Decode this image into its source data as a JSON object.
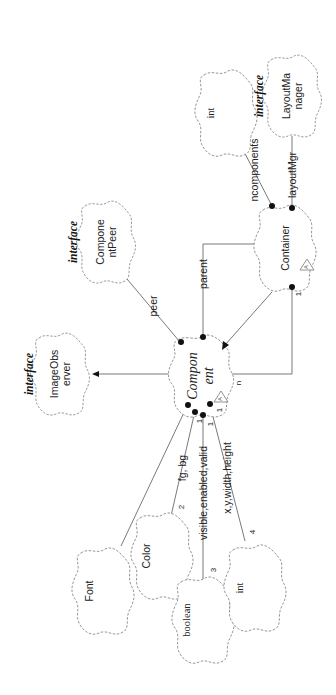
{
  "diagram": {
    "type": "Booch class diagram (rotated 90 degrees)",
    "classes": [
      {
        "id": "component",
        "name_line1": "Compon",
        "name_line2": "ent",
        "abstract": true,
        "adornment": "A"
      },
      {
        "id": "container",
        "name": "Container",
        "abstract": true,
        "adornment": "A"
      },
      {
        "id": "image_observer",
        "stereotype": "interface",
        "name_line1": "ImageObs",
        "name_line2": "erver"
      },
      {
        "id": "component_peer",
        "stereotype": "interface",
        "name_line1": "Compone",
        "name_line2": "ntPeer"
      },
      {
        "id": "layout_manager",
        "stereotype": "interface",
        "name_line1": "LayoutMa",
        "name_line2": "nager"
      },
      {
        "id": "int_top",
        "name": "int"
      },
      {
        "id": "font",
        "name": "Font"
      },
      {
        "id": "color",
        "name": "Color"
      },
      {
        "id": "boolean",
        "name": "boolean"
      },
      {
        "id": "int_bottom",
        "name": "int"
      }
    ],
    "relationships": [
      {
        "from": "component",
        "to": "image_observer",
        "kind": "inheritance"
      },
      {
        "from": "container",
        "to": "component",
        "kind": "inheritance"
      },
      {
        "from": "component",
        "to": "component_peer",
        "kind": "has",
        "label": "peer"
      },
      {
        "from": "component",
        "to": "container",
        "kind": "has",
        "label": "parent"
      },
      {
        "from": "container",
        "to": "component",
        "kind": "has",
        "multiplicity_from": "1",
        "multiplicity_to": "n"
      },
      {
        "from": "container",
        "to": "int_top",
        "kind": "has",
        "label": "ncomponents"
      },
      {
        "from": "container",
        "to": "layout_manager",
        "kind": "has",
        "label": "layoutMgr"
      },
      {
        "from": "component",
        "to": "font",
        "kind": "has"
      },
      {
        "from": "component",
        "to": "color",
        "kind": "has",
        "label": "fg, bg",
        "multiplicity_from": "1",
        "multiplicity_to": "2"
      },
      {
        "from": "component",
        "to": "boolean",
        "kind": "has",
        "label": "visible,enabled,valid",
        "multiplicity_from": "1",
        "multiplicity_to": "3"
      },
      {
        "from": "component",
        "to": "int_bottom",
        "kind": "has",
        "label": "x,y,width,height",
        "multiplicity_from": "1",
        "multiplicity_to": "4"
      }
    ]
  },
  "labels": {
    "interface": "interface",
    "component_1": "Compon",
    "component_2": "ent",
    "container": "Container",
    "image_observer_1": "ImageObs",
    "image_observer_2": "erver",
    "component_peer_1": "Compone",
    "component_peer_2": "ntPeer",
    "layout_manager_1": "LayoutMa",
    "layout_manager_2": "nager",
    "int": "int",
    "font": "Font",
    "color": "Color",
    "boolean": "boolean",
    "adorn_abstract": "A",
    "peer": "peer",
    "parent": "parent",
    "ncomponents": "ncomponents",
    "layoutMgr": "layoutMgr",
    "fg_bg": "fg, bg",
    "visible_enabled_valid": "visible,enabled,valid",
    "x_y_width_height": "x,y,width,height",
    "mult_1": "1",
    "mult_n": "n",
    "mult_2": "2",
    "mult_3": "3",
    "mult_4": "4"
  },
  "colors": {
    "background": "#ffffff",
    "line": "#6a6a6a",
    "cloud_border": "#8a8a8a",
    "text": "#222222",
    "dot": "#111111"
  }
}
